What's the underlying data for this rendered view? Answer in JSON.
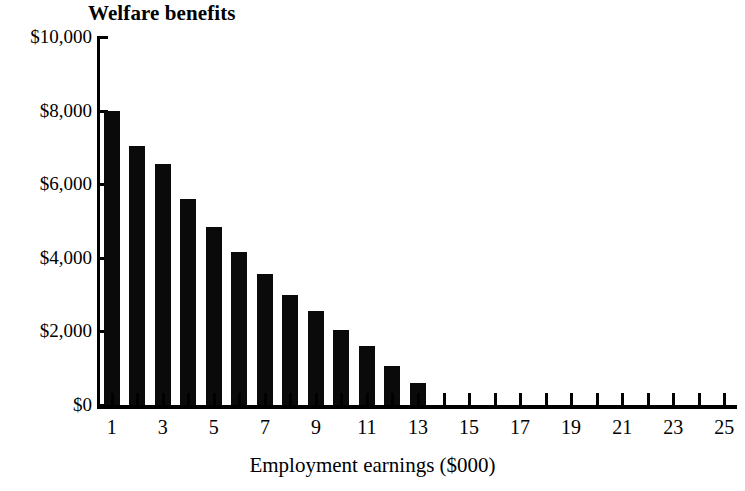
{
  "chart_data": {
    "type": "bar",
    "title": "Welfare benefits",
    "xlabel": "Employment earnings ($000)",
    "ylabel": "",
    "x": [
      1,
      2,
      3,
      4,
      5,
      6,
      7,
      8,
      9,
      10,
      11,
      12,
      13,
      14,
      15,
      16,
      17,
      18,
      19,
      20,
      21,
      22,
      23,
      24,
      25
    ],
    "values": [
      8000,
      7050,
      6550,
      5600,
      4850,
      4150,
      3550,
      3000,
      2550,
      2050,
      1600,
      1050,
      600,
      0,
      0,
      0,
      0,
      0,
      0,
      0,
      0,
      0,
      0,
      0,
      0
    ],
    "categories": [
      "1",
      "2",
      "3",
      "4",
      "5",
      "6",
      "7",
      "8",
      "9",
      "10",
      "11",
      "12",
      "13",
      "14",
      "15",
      "16",
      "17",
      "18",
      "19",
      "20",
      "21",
      "22",
      "23",
      "24",
      "25"
    ],
    "ylim": [
      0,
      10000
    ],
    "xlim": [
      0.4,
      25.6
    ],
    "y_ticks": [
      0,
      2000,
      4000,
      6000,
      8000,
      10000
    ],
    "y_tick_labels": [
      "$0",
      "$2,000",
      "$4,000",
      "$6,000",
      "$8,000",
      "$10,000"
    ],
    "x_ticks": [
      1,
      2,
      3,
      4,
      5,
      6,
      7,
      8,
      9,
      10,
      11,
      12,
      13,
      14,
      15,
      16,
      17,
      18,
      19,
      20,
      21,
      22,
      23,
      24,
      25
    ],
    "x_tick_labels_shown": [
      "1",
      "",
      "3",
      "",
      "5",
      "",
      "7",
      "",
      "9",
      "",
      "11",
      "",
      "13",
      "",
      "15",
      "",
      "17",
      "",
      "19",
      "",
      "21",
      "",
      "23",
      "",
      "25"
    ],
    "grid": false,
    "legend": null,
    "bar_color": "#0a0a0a",
    "axis_color": "#000000",
    "background": "#ffffff"
  }
}
